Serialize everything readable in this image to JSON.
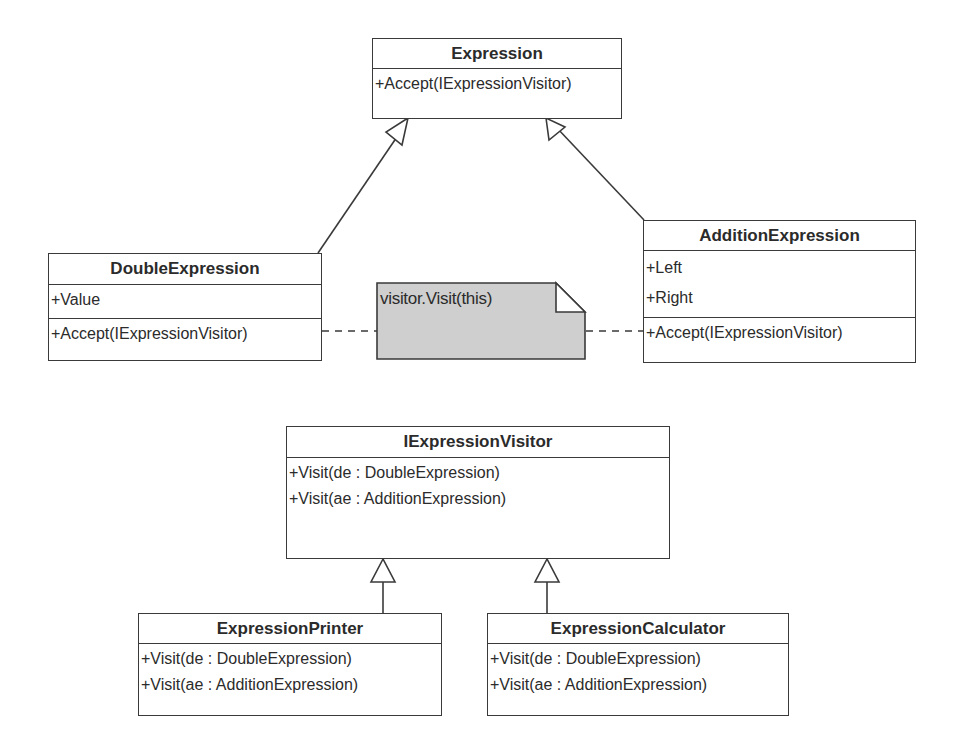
{
  "diagram": {
    "type": "UML class diagram",
    "colors": {
      "line": "#3a3a3a",
      "note_fill": "#cfcfcf",
      "background": "#ffffff"
    },
    "classes": {
      "expression": {
        "name": "Expression",
        "operations": [
          "+Accept(IExpressionVisitor)"
        ]
      },
      "double_expression": {
        "name": "DoubleExpression",
        "attributes": [
          "+Value"
        ],
        "operations": [
          "+Accept(IExpressionVisitor)"
        ]
      },
      "addition_expression": {
        "name": "AdditionExpression",
        "attributes": [
          "+Left",
          "+Right"
        ],
        "operations": [
          "+Accept(IExpressionVisitor)"
        ]
      },
      "iexpression_visitor": {
        "name": "IExpressionVisitor",
        "operations": [
          "+Visit(de : DoubleExpression)",
          "+Visit(ae : AdditionExpression)"
        ]
      },
      "expression_printer": {
        "name": "ExpressionPrinter",
        "operations": [
          "+Visit(de : DoubleExpression)",
          "+Visit(ae : AdditionExpression)"
        ]
      },
      "expression_calculator": {
        "name": "ExpressionCalculator",
        "operations": [
          "+Visit(de : DoubleExpression)",
          "+Visit(ae : AdditionExpression)"
        ]
      }
    },
    "note": {
      "text": "visitor.Visit(this)"
    },
    "relationships": [
      {
        "from": "DoubleExpression",
        "to": "Expression",
        "type": "generalization"
      },
      {
        "from": "AdditionExpression",
        "to": "Expression",
        "type": "generalization"
      },
      {
        "from": "ExpressionPrinter",
        "to": "IExpressionVisitor",
        "type": "generalization"
      },
      {
        "from": "ExpressionCalculator",
        "to": "IExpressionVisitor",
        "type": "generalization"
      },
      {
        "from": "note",
        "to": "DoubleExpression",
        "type": "note-link"
      },
      {
        "from": "note",
        "to": "AdditionExpression",
        "type": "note-link"
      }
    ]
  }
}
